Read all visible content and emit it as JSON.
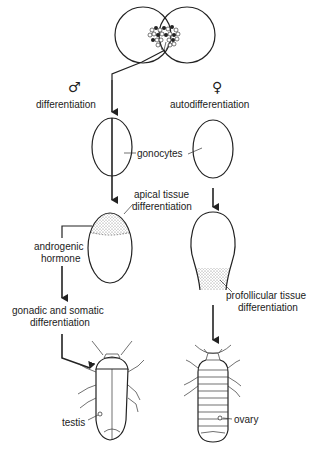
{
  "diagram": {
    "male": {
      "symbol": "♂",
      "step1": "differentiation",
      "hormone_line1": "androgenic",
      "hormone_line2": "hormone",
      "apical_line1": "apical tissue",
      "apical_line2": "differentiation",
      "somatic_line1": "gonadic and somatic",
      "somatic_line2": "differentiation",
      "organ": "testis"
    },
    "female": {
      "symbol": "♀",
      "step1": "autodifferentiation",
      "profollicular_line1": "profollicular tissue",
      "profollicular_line2": "differentiation",
      "organ": "ovary"
    },
    "shared": {
      "gonocytes": "gonocytes"
    },
    "colors": {
      "stroke": "#222222",
      "stipple": "#888888",
      "background": "#ffffff"
    }
  }
}
